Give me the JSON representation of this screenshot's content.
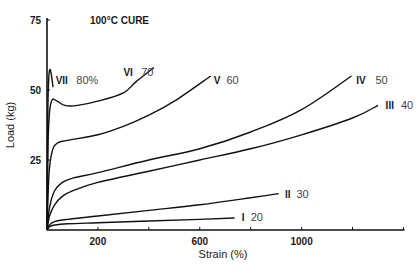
{
  "chart_data": {
    "type": "line",
    "title": "100°C CURE",
    "xlabel": "Strain (%)",
    "ylabel": "Load (kg)",
    "xlim": [
      0,
      1400
    ],
    "ylim": [
      0,
      75
    ],
    "x_ticks": [
      200,
      400,
      600,
      800,
      1000,
      1200,
      1400
    ],
    "x_tick_labels": [
      {
        "value": 200,
        "label": "200"
      },
      {
        "value": 600,
        "label": "600"
      },
      {
        "value": 1000,
        "label": "1000"
      }
    ],
    "y_ticks": [
      {
        "value": 25,
        "label": "25"
      },
      {
        "value": 50,
        "label": "50"
      },
      {
        "value": 75,
        "label": "75"
      }
    ],
    "grid": false,
    "legend": "inline labels at curve ends",
    "series": [
      {
        "name": "I",
        "label_roman": "I",
        "label_pct": "20",
        "points": [
          [
            0,
            0
          ],
          [
            10,
            1.2
          ],
          [
            30,
            1.8
          ],
          [
            80,
            2.2
          ],
          [
            200,
            2.6
          ],
          [
            400,
            3.2
          ],
          [
            600,
            3.8
          ],
          [
            737,
            4.3
          ]
        ]
      },
      {
        "name": "II",
        "label_roman": "II",
        "label_pct": "30",
        "points": [
          [
            0,
            0
          ],
          [
            10,
            1.8
          ],
          [
            30,
            3.0
          ],
          [
            80,
            3.8
          ],
          [
            200,
            5.0
          ],
          [
            400,
            7.0
          ],
          [
            600,
            9.0
          ],
          [
            800,
            11.5
          ],
          [
            910,
            13
          ]
        ]
      },
      {
        "name": "III",
        "label_roman": "III",
        "label_pct": "40",
        "points": [
          [
            0,
            0
          ],
          [
            10,
            5
          ],
          [
            30,
            9
          ],
          [
            60,
            12
          ],
          [
            100,
            14
          ],
          [
            200,
            17
          ],
          [
            400,
            21
          ],
          [
            600,
            25
          ],
          [
            800,
            29
          ],
          [
            1000,
            34
          ],
          [
            1200,
            40
          ],
          [
            1300,
            44.5
          ]
        ]
      },
      {
        "name": "IV",
        "label_roman": "IV",
        "label_pct": "50",
        "points": [
          [
            0,
            0
          ],
          [
            10,
            8
          ],
          [
            30,
            14
          ],
          [
            60,
            17
          ],
          [
            100,
            18.5
          ],
          [
            200,
            20.5
          ],
          [
            400,
            25
          ],
          [
            600,
            29
          ],
          [
            800,
            35
          ],
          [
            1000,
            43
          ],
          [
            1196,
            55
          ]
        ]
      },
      {
        "name": "V",
        "label_roman": "V",
        "label_pct": "60",
        "points": [
          [
            0,
            0
          ],
          [
            8,
            20
          ],
          [
            20,
            28
          ],
          [
            40,
            31
          ],
          [
            80,
            32
          ],
          [
            200,
            34
          ],
          [
            300,
            37
          ],
          [
            400,
            41
          ],
          [
            500,
            46
          ],
          [
            643,
            55
          ]
        ]
      },
      {
        "name": "VI",
        "label_roman": "VI",
        "label_pct": "70",
        "points": [
          [
            0,
            0
          ],
          [
            4,
            30
          ],
          [
            10,
            42
          ],
          [
            20,
            46.5
          ],
          [
            40,
            46
          ],
          [
            70,
            44.5
          ],
          [
            120,
            44.5
          ],
          [
            200,
            46
          ],
          [
            300,
            49
          ],
          [
            350,
            53
          ],
          [
            420,
            58
          ]
        ]
      },
      {
        "name": "VII",
        "label_roman": "VII",
        "label_pct": "80%",
        "points": [
          [
            0,
            0
          ],
          [
            3,
            40
          ],
          [
            6,
            52
          ],
          [
            10,
            57
          ],
          [
            16,
            56
          ],
          [
            24,
            51
          ]
        ]
      }
    ],
    "label_positions": [
      {
        "series": "I",
        "roman_at": [
          765,
          4.6
        ],
        "pct_at": [
          800,
          4.6
        ]
      },
      {
        "series": "II",
        "roman_at": [
          935,
          12.8
        ],
        "pct_at": [
          980,
          12.8
        ]
      },
      {
        "series": "III",
        "roman_at": [
          1330,
          44.5
        ],
        "pct_at": [
          1390,
          44.5
        ]
      },
      {
        "series": "IV",
        "roman_at": [
          1215,
          53.5
        ],
        "pct_at": [
          1290,
          53.5
        ]
      },
      {
        "series": "V",
        "roman_at": [
          655,
          53.5
        ],
        "pct_at": [
          705,
          53.5
        ]
      },
      {
        "series": "VI",
        "roman_at": [
          300,
          56.5
        ],
        "pct_at": [
          370,
          56.5
        ]
      },
      {
        "series": "VII",
        "roman_at": [
          34,
          53.5
        ],
        "pct_at": [
          115,
          53.5
        ]
      }
    ]
  }
}
